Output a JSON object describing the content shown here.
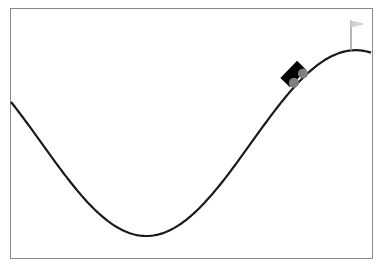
{
  "environment": {
    "name": "MountainCar",
    "x_range": [
      -1.2,
      0.6
    ],
    "terrain_function": "sin(3x)",
    "goal_position": 0.5,
    "car_position": 0.246
  },
  "colors": {
    "background": "#ffffff",
    "frame": "#8a8a8a",
    "terrain": "#1a1a1a",
    "car_body": "#000000",
    "wheels": "#7f7f7f",
    "flag_pole": "#a0a0a0",
    "flag": "#d0d0d0"
  },
  "viewport": {
    "left": 11,
    "top": 9,
    "right": 371,
    "bottom": 257,
    "y_zero_px": 143.1,
    "y_scale_px": 92.9
  }
}
